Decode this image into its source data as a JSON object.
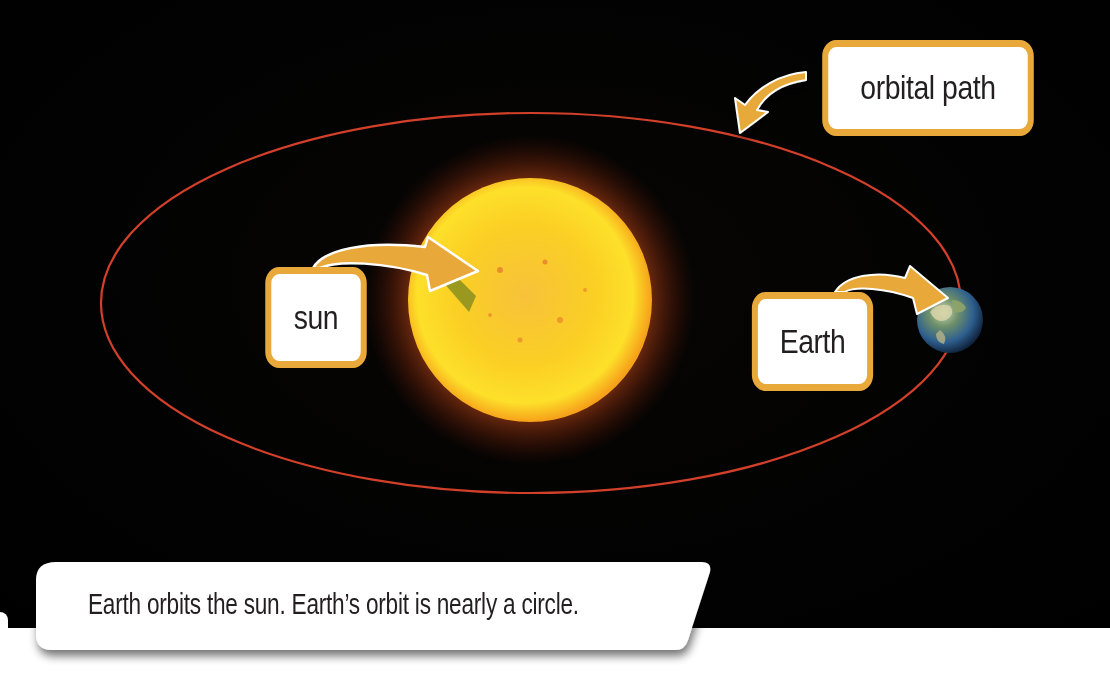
{
  "diagram": {
    "background": {
      "space_color": "#000000",
      "page_color": "#ffffff"
    },
    "orbit": {
      "name": "orbital path",
      "shape": "ellipse",
      "center": [
        530,
        303
      ],
      "radius_x": 430,
      "radius_y": 190,
      "stroke_color": "#d2402a"
    },
    "bodies": [
      {
        "name": "sun",
        "center": [
          530,
          300
        ],
        "radius": 120,
        "color": "#fbd21a",
        "glow_color": "#e8661a"
      },
      {
        "name": "Earth",
        "center": [
          950,
          320
        ],
        "radius": 32,
        "color": "#3f6f9e"
      }
    ],
    "labels": {
      "orbital_path": "orbital path",
      "sun": "sun",
      "earth": "Earth"
    },
    "label_style": {
      "border_color": "#e8a93a",
      "fill": "#ffffff",
      "text_color": "#231f20"
    },
    "arrows": [
      {
        "from": "orbital path label",
        "to": "orbital path",
        "color": "#e8a93a"
      },
      {
        "from": "sun label",
        "to": "sun",
        "color": "#e8a93a"
      },
      {
        "from": "Earth label",
        "to": "Earth",
        "color": "#e8a93a"
      }
    ],
    "caption": "Earth orbits the sun. Earth’s orbit is nearly a circle."
  }
}
